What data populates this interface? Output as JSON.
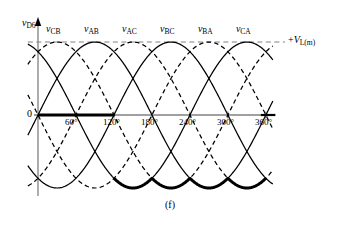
{
  "figure": {
    "caption": "(f)",
    "y_axis_label_var": "v",
    "y_axis_label_sub": "D6",
    "zero_label": "0",
    "right_label_prefix": "+",
    "right_label_var": "V",
    "right_label_sub": "L(m)",
    "degree_symbol": "°"
  },
  "axes": {
    "x_ticks": [
      "60°",
      "120°",
      "180°",
      "240°",
      "300°",
      "360°"
    ],
    "x_tick_values": [
      60,
      120,
      180,
      240,
      300,
      360
    ],
    "x_range": [
      -15,
      390
    ],
    "y_range": [
      -1.32,
      1.45
    ],
    "origin_px": {
      "x": 38,
      "y": 115
    },
    "px_per_degree": 0.633,
    "amplitude_px": 73,
    "peak_level_px": 42,
    "trough_level_px": 186
  },
  "colors": {
    "curve": "#000000",
    "axis": "#808080",
    "emphasis": "#000000",
    "reference_line": "#808080",
    "background": "#ffffff"
  },
  "curve_labels": [
    {
      "var": "v",
      "sub": "CB",
      "x_deg": 30
    },
    {
      "var": "v",
      "sub": "AB",
      "x_deg": 90
    },
    {
      "var": "v",
      "sub": "AC",
      "x_deg": 150
    },
    {
      "var": "v",
      "sub": "BC",
      "x_deg": 210
    },
    {
      "var": "v",
      "sub": "BA",
      "x_deg": 270
    },
    {
      "var": "v",
      "sub": "CA",
      "x_deg": 330
    }
  ],
  "chart_data": {
    "type": "line",
    "title": "",
    "xlabel": "",
    "ylabel": "v D6",
    "xlim": [
      -15,
      390
    ],
    "ylim": [
      -1.32,
      1.45
    ],
    "grid": false,
    "legend": "inline-above-peaks",
    "annotations": [
      {
        "text": "+V L(m)",
        "type": "horizontal-reference-line",
        "y": 1.0,
        "style": "dashed"
      },
      {
        "text": "0",
        "type": "axis-origin",
        "y": 0
      }
    ],
    "x_tick_labels": [
      "60°",
      "120°",
      "180°",
      "240°",
      "300°",
      "360°"
    ],
    "series": [
      {
        "name": "v_CB",
        "style": "dashed",
        "amplitude": 1.0,
        "phase_peak_deg": 30,
        "form": "sine-peak-at-phase"
      },
      {
        "name": "v_AB",
        "style": "solid",
        "amplitude": 1.0,
        "phase_peak_deg": 90,
        "form": "sine-peak-at-phase"
      },
      {
        "name": "v_AC",
        "style": "dashed",
        "amplitude": 1.0,
        "phase_peak_deg": 150,
        "form": "sine-peak-at-phase"
      },
      {
        "name": "v_BC",
        "style": "solid",
        "amplitude": 1.0,
        "phase_peak_deg": 210,
        "form": "sine-peak-at-phase"
      },
      {
        "name": "v_BA",
        "style": "dashed",
        "amplitude": 1.0,
        "phase_peak_deg": 270,
        "form": "sine-peak-at-phase"
      },
      {
        "name": "v_CA",
        "style": "solid",
        "amplitude": 1.0,
        "phase_peak_deg": 330,
        "form": "sine-peak-at-phase"
      }
    ],
    "emphasis_trace": {
      "name": "v_D6",
      "style": "thick-solid",
      "description": "Zero from 0° to 120°, then follows the most-negative envelope of the line voltages from 120° to 360°",
      "segments": [
        {
          "from_deg": 0,
          "to_deg": 120,
          "value": 0
        },
        {
          "from_deg": 120,
          "to_deg": 360,
          "value": "negative-envelope"
        }
      ]
    }
  }
}
